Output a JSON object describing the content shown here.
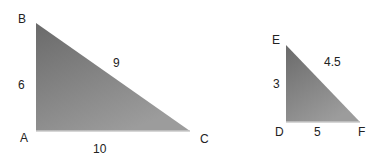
{
  "diagram": {
    "type": "similar-triangles",
    "fill_top": "#6a6a6a",
    "fill_bottom": "#a2a2a2",
    "triangles": [
      {
        "name": "ABC",
        "vertices": {
          "A": {
            "label": "A",
            "x": 36,
            "y": 131
          },
          "B": {
            "label": "B",
            "x": 36,
            "y": 23
          },
          "C": {
            "label": "C",
            "x": 190,
            "y": 131
          }
        },
        "sides": {
          "AB": "6",
          "BC": "9",
          "AC": "10"
        }
      },
      {
        "name": "DEF",
        "vertices": {
          "D": {
            "label": "D",
            "x": 286,
            "y": 122
          },
          "E": {
            "label": "E",
            "x": 286,
            "y": 45
          },
          "F": {
            "label": "F",
            "x": 360,
            "y": 122
          }
        },
        "sides": {
          "DE": "3",
          "EF": "4.5",
          "DF": "5"
        }
      }
    ]
  }
}
